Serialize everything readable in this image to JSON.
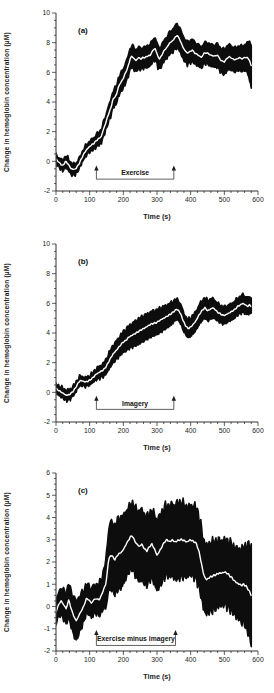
{
  "figure": {
    "background": "#ffffff",
    "band_color": "#0d0d0d",
    "mean_line_color": "#ffffff",
    "axis_color": "#1c1c1c",
    "text_color": "#1c1c1c"
  },
  "chart_data": [
    {
      "type": "line",
      "panel_label": "(a)",
      "xlabel": "Time (s)",
      "ylabel": "Change in hemoglobin concentration (µM)",
      "xlim": [
        0,
        600
      ],
      "ylim": [
        -2,
        10
      ],
      "x_major_step": 100,
      "x_minor_step": 20,
      "y_major_step": 2,
      "y_minor_step": 0.5,
      "legend": "none",
      "annotation": {
        "label": "Exercise",
        "t_start": 120,
        "t_end": 350,
        "v_arrow_top": -0.35,
        "v_line": -1.2
      },
      "series": [
        {
          "name": "group mean (white line) with inter-subject variability band (black)"
        }
      ],
      "mean_points": [
        [
          0,
          0.15
        ],
        [
          10,
          -0.1
        ],
        [
          20,
          -0.3
        ],
        [
          28,
          0.0
        ],
        [
          35,
          -0.15
        ],
        [
          45,
          -0.5
        ],
        [
          55,
          -0.55
        ],
        [
          62,
          -0.4
        ],
        [
          70,
          -0.1
        ],
        [
          78,
          0.3
        ],
        [
          85,
          0.6
        ],
        [
          95,
          0.9
        ],
        [
          105,
          1.1
        ],
        [
          112,
          1.2
        ],
        [
          120,
          1.4
        ],
        [
          128,
          1.55
        ],
        [
          135,
          1.7
        ],
        [
          140,
          2.1
        ],
        [
          148,
          2.6
        ],
        [
          153,
          3.0
        ],
        [
          158,
          3.3
        ],
        [
          163,
          3.6
        ],
        [
          168,
          4.1
        ],
        [
          173,
          4.3
        ],
        [
          180,
          4.5
        ],
        [
          185,
          5.0
        ],
        [
          192,
          5.3
        ],
        [
          200,
          5.6
        ],
        [
          207,
          6.0
        ],
        [
          213,
          6.3
        ],
        [
          220,
          6.9
        ],
        [
          226,
          7.1
        ],
        [
          232,
          6.9
        ],
        [
          238,
          6.8
        ],
        [
          245,
          7.0
        ],
        [
          252,
          6.9
        ],
        [
          258,
          7.0
        ],
        [
          265,
          7.0
        ],
        [
          272,
          7.1
        ],
        [
          280,
          7.15
        ],
        [
          288,
          7.5
        ],
        [
          295,
          7.6
        ],
        [
          302,
          7.1
        ],
        [
          308,
          6.9
        ],
        [
          315,
          7.2
        ],
        [
          322,
          7.5
        ],
        [
          330,
          7.7
        ],
        [
          338,
          8.0
        ],
        [
          345,
          8.1
        ],
        [
          352,
          8.3
        ],
        [
          360,
          8.5
        ],
        [
          368,
          8.2
        ],
        [
          375,
          7.8
        ],
        [
          382,
          7.5
        ],
        [
          390,
          7.3
        ],
        [
          398,
          7.4
        ],
        [
          405,
          7.5
        ],
        [
          412,
          7.3
        ],
        [
          420,
          7.2
        ],
        [
          432,
          7.0
        ],
        [
          440,
          7.3
        ],
        [
          450,
          7.3
        ],
        [
          460,
          7.15
        ],
        [
          470,
          7.1
        ],
        [
          480,
          7.15
        ],
        [
          490,
          6.8
        ],
        [
          500,
          6.7
        ],
        [
          508,
          6.95
        ],
        [
          515,
          7.05
        ],
        [
          522,
          6.95
        ],
        [
          530,
          6.85
        ],
        [
          538,
          6.9
        ],
        [
          545,
          7.0
        ],
        [
          552,
          6.9
        ],
        [
          560,
          7.0
        ],
        [
          568,
          7.0
        ],
        [
          575,
          6.8
        ],
        [
          580,
          6.4
        ]
      ],
      "band_halfwidth": [
        [
          0,
          0.3
        ],
        [
          40,
          0.4
        ],
        [
          70,
          0.35
        ],
        [
          100,
          0.35
        ],
        [
          130,
          0.45
        ],
        [
          160,
          0.55
        ],
        [
          200,
          0.65
        ],
        [
          230,
          0.75
        ],
        [
          260,
          0.7
        ],
        [
          290,
          0.75
        ],
        [
          320,
          0.7
        ],
        [
          360,
          0.8
        ],
        [
          400,
          0.75
        ],
        [
          440,
          0.7
        ],
        [
          470,
          0.75
        ],
        [
          500,
          0.85
        ],
        [
          540,
          0.8
        ],
        [
          565,
          0.9
        ],
        [
          580,
          1.5
        ]
      ]
    },
    {
      "type": "line",
      "panel_label": "(b)",
      "xlabel": "Time (s)",
      "ylabel": "Change in hemoglobin concentration (µM)",
      "xlim": [
        0,
        600
      ],
      "ylim": [
        -2,
        10
      ],
      "x_major_step": 100,
      "x_minor_step": 20,
      "y_major_step": 2,
      "y_minor_step": 0.5,
      "legend": "none",
      "annotation": {
        "label": "Imagery",
        "t_start": 120,
        "t_end": 350,
        "v_arrow_top": -0.3,
        "v_line": -1.15
      },
      "series": [
        {
          "name": "group mean (white line) with inter-subject variability band (black)"
        }
      ],
      "mean_points": [
        [
          0,
          0.25
        ],
        [
          10,
          0.1
        ],
        [
          20,
          -0.05
        ],
        [
          30,
          -0.2
        ],
        [
          40,
          -0.15
        ],
        [
          50,
          0.05
        ],
        [
          58,
          0.3
        ],
        [
          65,
          0.6
        ],
        [
          72,
          0.8
        ],
        [
          80,
          0.75
        ],
        [
          88,
          0.7
        ],
        [
          95,
          0.75
        ],
        [
          102,
          0.85
        ],
        [
          110,
          1.0
        ],
        [
          118,
          1.2
        ],
        [
          125,
          1.3
        ],
        [
          132,
          1.4
        ],
        [
          140,
          1.5
        ],
        [
          148,
          1.7
        ],
        [
          155,
          2.0
        ],
        [
          162,
          2.3
        ],
        [
          170,
          2.6
        ],
        [
          178,
          2.8
        ],
        [
          185,
          3.0
        ],
        [
          192,
          3.2
        ],
        [
          200,
          3.4
        ],
        [
          208,
          3.5
        ],
        [
          215,
          3.7
        ],
        [
          222,
          3.8
        ],
        [
          230,
          3.9
        ],
        [
          238,
          4.0
        ],
        [
          245,
          4.1
        ],
        [
          252,
          4.2
        ],
        [
          260,
          4.3
        ],
        [
          268,
          4.4
        ],
        [
          275,
          4.5
        ],
        [
          282,
          4.6
        ],
        [
          290,
          4.65
        ],
        [
          298,
          4.7
        ],
        [
          305,
          4.8
        ],
        [
          312,
          4.9
        ],
        [
          320,
          5.0
        ],
        [
          328,
          5.1
        ],
        [
          335,
          5.2
        ],
        [
          342,
          5.3
        ],
        [
          350,
          5.45
        ],
        [
          358,
          5.6
        ],
        [
          365,
          5.5
        ],
        [
          372,
          5.2
        ],
        [
          378,
          4.8
        ],
        [
          385,
          4.5
        ],
        [
          392,
          4.3
        ],
        [
          400,
          4.4
        ],
        [
          408,
          4.6
        ],
        [
          415,
          4.8
        ],
        [
          422,
          5.1
        ],
        [
          430,
          5.4
        ],
        [
          437,
          5.6
        ],
        [
          443,
          5.7
        ],
        [
          450,
          5.5
        ],
        [
          458,
          5.6
        ],
        [
          465,
          5.7
        ],
        [
          472,
          5.6
        ],
        [
          480,
          5.4
        ],
        [
          488,
          5.3
        ],
        [
          495,
          5.2
        ],
        [
          502,
          5.2
        ],
        [
          510,
          5.3
        ],
        [
          518,
          5.4
        ],
        [
          525,
          5.5
        ],
        [
          532,
          5.6
        ],
        [
          540,
          5.8
        ],
        [
          548,
          5.9
        ],
        [
          555,
          6.0
        ],
        [
          562,
          5.9
        ],
        [
          570,
          5.8
        ],
        [
          575,
          5.9
        ],
        [
          580,
          5.8
        ]
      ],
      "band_halfwidth": [
        [
          0,
          0.3
        ],
        [
          35,
          0.35
        ],
        [
          70,
          0.3
        ],
        [
          100,
          0.3
        ],
        [
          130,
          0.4
        ],
        [
          160,
          0.55
        ],
        [
          200,
          0.7
        ],
        [
          240,
          0.85
        ],
        [
          280,
          0.85
        ],
        [
          320,
          0.8
        ],
        [
          355,
          0.7
        ],
        [
          390,
          0.6
        ],
        [
          420,
          0.65
        ],
        [
          450,
          0.7
        ],
        [
          480,
          0.6
        ],
        [
          520,
          0.55
        ],
        [
          560,
          0.6
        ],
        [
          580,
          0.55
        ]
      ]
    },
    {
      "type": "line",
      "panel_label": "(c)",
      "xlabel": "Time (s)",
      "ylabel": "Change in hemoglobin concentration (µM)",
      "xlim": [
        0,
        600
      ],
      "ylim": [
        -2,
        6
      ],
      "x_major_step": 100,
      "x_minor_step": 20,
      "y_major_step": 1,
      "y_minor_step": 0.25,
      "legend": "none",
      "annotation": {
        "label": "Exercise minus imagery",
        "t_start": 120,
        "t_end": 355,
        "v_arrow_top": -1.1,
        "v_line": -1.75
      },
      "series": [
        {
          "name": "group mean (white line) with inter-subject variability band (black)"
        }
      ],
      "mean_points": [
        [
          0,
          -0.25
        ],
        [
          8,
          0.1
        ],
        [
          15,
          0.25
        ],
        [
          22,
          0.1
        ],
        [
          30,
          -0.1
        ],
        [
          38,
          0.3
        ],
        [
          45,
          -0.1
        ],
        [
          52,
          -0.4
        ],
        [
          60,
          -0.65
        ],
        [
          68,
          -0.4
        ],
        [
          75,
          -0.2
        ],
        [
          82,
          0.0
        ],
        [
          90,
          0.35
        ],
        [
          98,
          0.3
        ],
        [
          105,
          0.15
        ],
        [
          112,
          0.3
        ],
        [
          120,
          0.35
        ],
        [
          128,
          0.3
        ],
        [
          135,
          0.5
        ],
        [
          142,
          0.8
        ],
        [
          148,
          1.0
        ],
        [
          152,
          1.5
        ],
        [
          156,
          2.1
        ],
        [
          162,
          2.3
        ],
        [
          168,
          2.25
        ],
        [
          175,
          2.1
        ],
        [
          182,
          2.3
        ],
        [
          190,
          2.4
        ],
        [
          198,
          2.5
        ],
        [
          205,
          2.7
        ],
        [
          212,
          2.9
        ],
        [
          220,
          3.1
        ],
        [
          226,
          3.2
        ],
        [
          232,
          3.0
        ],
        [
          240,
          2.8
        ],
        [
          248,
          2.7
        ],
        [
          255,
          2.8
        ],
        [
          262,
          2.6
        ],
        [
          270,
          2.5
        ],
        [
          278,
          2.7
        ],
        [
          285,
          2.8
        ],
        [
          292,
          2.6
        ],
        [
          300,
          2.3
        ],
        [
          308,
          2.5
        ],
        [
          315,
          2.7
        ],
        [
          322,
          2.9
        ],
        [
          330,
          3.0
        ],
        [
          338,
          2.9
        ],
        [
          345,
          3.0
        ],
        [
          352,
          2.9
        ],
        [
          360,
          2.95
        ],
        [
          368,
          3.0
        ],
        [
          375,
          3.0
        ],
        [
          382,
          2.95
        ],
        [
          390,
          2.9
        ],
        [
          398,
          3.0
        ],
        [
          405,
          2.95
        ],
        [
          412,
          2.9
        ],
        [
          418,
          2.8
        ],
        [
          424,
          2.5
        ],
        [
          430,
          2.1
        ],
        [
          436,
          1.6
        ],
        [
          442,
          1.3
        ],
        [
          448,
          1.2
        ],
        [
          455,
          1.3
        ],
        [
          462,
          1.35
        ],
        [
          470,
          1.4
        ],
        [
          478,
          1.45
        ],
        [
          485,
          1.5
        ],
        [
          492,
          1.5
        ],
        [
          500,
          1.55
        ],
        [
          508,
          1.5
        ],
        [
          515,
          1.4
        ],
        [
          522,
          1.3
        ],
        [
          530,
          1.15
        ],
        [
          538,
          1.05
        ],
        [
          545,
          1.0
        ],
        [
          552,
          0.95
        ],
        [
          558,
          1.0
        ],
        [
          565,
          0.9
        ],
        [
          572,
          0.75
        ],
        [
          580,
          0.5
        ]
      ],
      "band_halfwidth": [
        [
          0,
          0.5
        ],
        [
          30,
          0.7
        ],
        [
          60,
          0.9
        ],
        [
          90,
          0.65
        ],
        [
          120,
          0.65
        ],
        [
          140,
          0.8
        ],
        [
          160,
          1.5
        ],
        [
          190,
          1.6
        ],
        [
          220,
          1.45
        ],
        [
          250,
          1.6
        ],
        [
          280,
          1.5
        ],
        [
          300,
          1.6
        ],
        [
          330,
          1.55
        ],
        [
          360,
          1.7
        ],
        [
          395,
          1.55
        ],
        [
          420,
          1.6
        ],
        [
          445,
          1.55
        ],
        [
          470,
          1.5
        ],
        [
          500,
          1.45
        ],
        [
          530,
          1.5
        ],
        [
          560,
          1.7
        ],
        [
          580,
          2.2
        ]
      ]
    }
  ]
}
